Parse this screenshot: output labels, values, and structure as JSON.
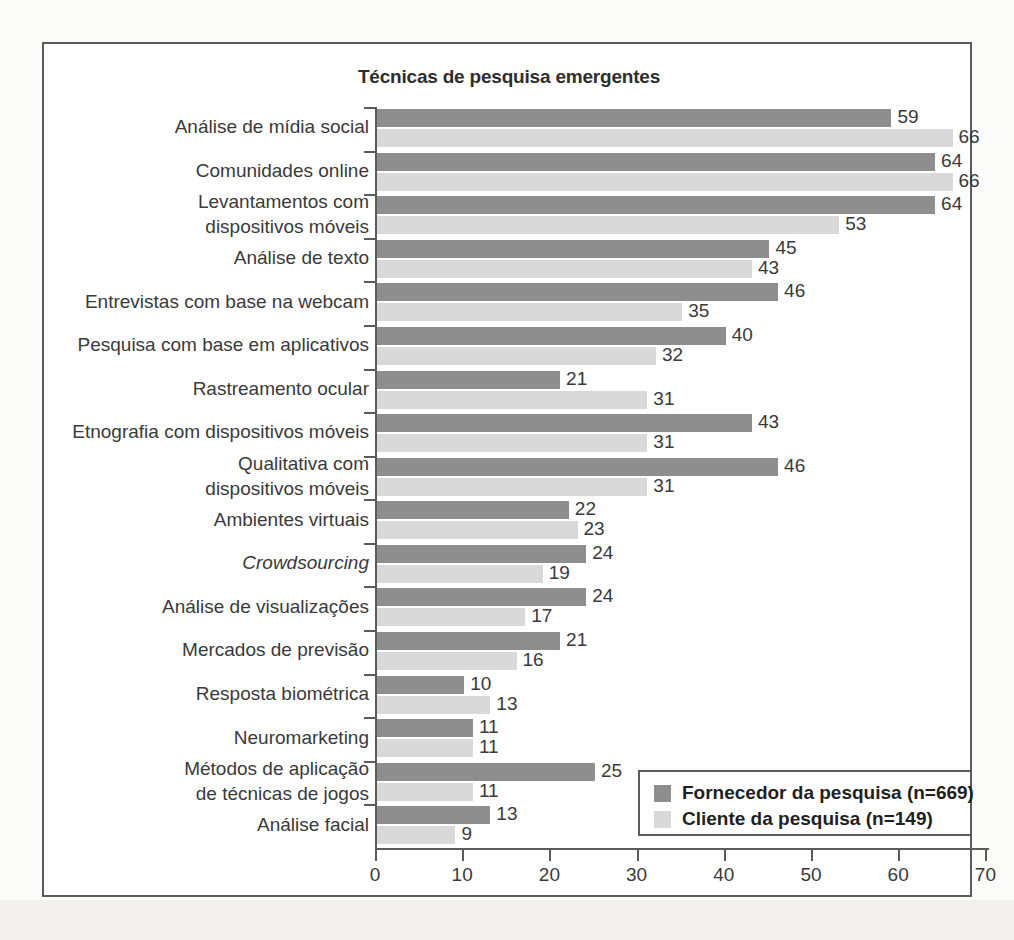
{
  "chart_data": {
    "type": "bar",
    "orientation": "horizontal",
    "title": "Técnicas de pesquisa emergentes",
    "xlabel": "",
    "ylabel": "",
    "xlim": [
      0,
      70
    ],
    "xticks": [
      0,
      10,
      20,
      30,
      40,
      50,
      60,
      70
    ],
    "grid": false,
    "legend_position": "bottom-right",
    "categories": [
      "Análise de mídia social",
      "Comunidades online",
      "Levantamentos com\ndispositivos móveis",
      "Análise de texto",
      "Entrevistas com base na webcam",
      "Pesquisa com base em aplicativos",
      "Rastreamento ocular",
      "Etnografia com dispositivos móveis",
      "Qualitativa com\ndispositivos móveis",
      "Ambientes virtuais",
      "Crowdsourcing",
      "Análise de visualizações",
      "Mercados de previsão",
      "Resposta biométrica",
      "Neuromarketing",
      "Métodos de aplicação\nde técnicas de jogos",
      "Análise facial"
    ],
    "category_styles": [
      "normal",
      "normal",
      "normal",
      "normal",
      "normal",
      "normal",
      "normal",
      "normal",
      "normal",
      "normal",
      "italic",
      "normal",
      "normal",
      "normal",
      "normal",
      "normal",
      "normal"
    ],
    "series": [
      {
        "name": "Fornecedor da pesquisa (n=669)",
        "color": "#8e8e8e",
        "values": [
          59,
          64,
          64,
          45,
          46,
          40,
          21,
          43,
          46,
          22,
          24,
          24,
          21,
          10,
          11,
          25,
          13
        ]
      },
      {
        "name": "Cliente da pesquisa (n=149)",
        "color": "#d9d9d9",
        "values": [
          66,
          66,
          53,
          43,
          35,
          32,
          31,
          31,
          31,
          23,
          19,
          17,
          16,
          13,
          11,
          11,
          9
        ]
      }
    ]
  },
  "legend": {
    "items": [
      {
        "label": "Fornecedor da pesquisa (n=669)",
        "swatch": "supplier"
      },
      {
        "label": "Cliente da pesquisa (n=149)",
        "swatch": "client"
      }
    ]
  },
  "colors": {
    "supplier": "#8e8e8e",
    "client": "#d9d9d9",
    "axis": "#5b5b5b",
    "text": "#3a3a3a",
    "background": "#ffffff"
  }
}
